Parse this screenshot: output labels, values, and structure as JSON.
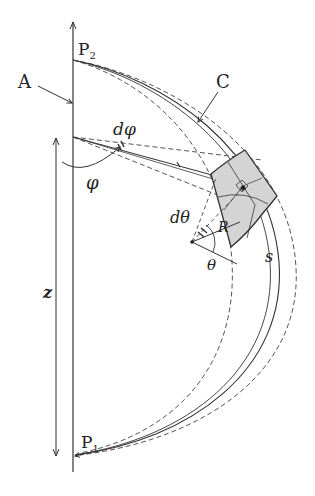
{
  "figure": {
    "type": "geometric diagram",
    "labels": {
      "P2": "P",
      "P2_sub": "2",
      "P1": "P",
      "P1_sub": "1",
      "A": "A",
      "C": "C",
      "d_phi": "dφ",
      "phi": "φ",
      "r": "r",
      "d_theta": "dθ",
      "R": "R",
      "theta": "θ",
      "s": "s",
      "z": "z"
    },
    "colors": {
      "line": "#333333",
      "dashed": "#555555",
      "patch_fill": "#d4d4d4",
      "background": "#ffffff"
    }
  }
}
